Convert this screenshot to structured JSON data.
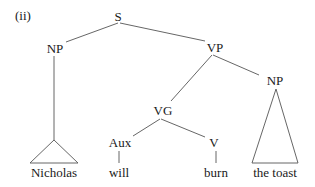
{
  "diagram": {
    "type": "syntax-tree",
    "example_label": "(ii)",
    "nodes": {
      "s": {
        "label": "S"
      },
      "np_subject": {
        "label": "NP"
      },
      "vp": {
        "label": "VP"
      },
      "vg": {
        "label": "VG"
      },
      "np_object": {
        "label": "NP"
      },
      "aux": {
        "label": "Aux"
      },
      "v": {
        "label": "V"
      }
    },
    "leaves": {
      "nicholas": "Nicholas",
      "will": "will",
      "burn": "burn",
      "the_toast": "the toast"
    },
    "edges": [
      [
        "S",
        "NP"
      ],
      [
        "S",
        "VP"
      ],
      [
        "NP",
        "Nicholas (triangle)"
      ],
      [
        "VP",
        "VG"
      ],
      [
        "VP",
        "NP"
      ],
      [
        "VG",
        "Aux"
      ],
      [
        "VG",
        "V"
      ],
      [
        "Aux",
        "will"
      ],
      [
        "V",
        "burn"
      ],
      [
        "NP",
        "the toast (triangle)"
      ]
    ]
  }
}
